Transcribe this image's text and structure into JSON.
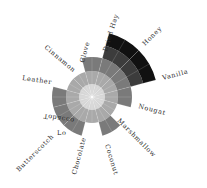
{
  "chart_data": {
    "type": "polar-area",
    "title": "",
    "center": [
      92,
      97
    ],
    "ring_radii": [
      13,
      26,
      40,
      53,
      66
    ],
    "ring_colors": [
      "#d6d6d6",
      "#a9a9a9",
      "#7a7a7a",
      "#3c3c3c",
      "#111111"
    ],
    "categories": [
      "Dried Hay",
      "Honey",
      "Vanilla",
      "Nougat",
      "Marshmallow",
      "Coconut",
      "Chocolate",
      "Butterscotch",
      "Tobacco",
      "Leather",
      "Cinnamon",
      "Clove"
    ],
    "values": [
      3,
      5,
      5,
      3,
      2,
      3,
      2,
      3,
      3,
      3,
      2,
      2
    ],
    "start_angle_deg": -15,
    "segment_span_deg": 30,
    "annotations": [
      {
        "text": "Lo",
        "near": "Butterscotch"
      }
    ],
    "grid": true,
    "legend": "none"
  },
  "labels": {
    "dried_hay": "Dried Hay",
    "honey": "Honey",
    "vanilla": "Vanilla",
    "nougat": "Nougat",
    "marshmallow": "Marshmallow",
    "coconut": "Coconut",
    "chocolate": "Chocolate",
    "lo": "Lo",
    "butterscotch": "Butterscotch",
    "tobacco": "Tobacco",
    "leather": "Leather",
    "cinnamon": "Cinnamon",
    "clove": "Clove"
  }
}
